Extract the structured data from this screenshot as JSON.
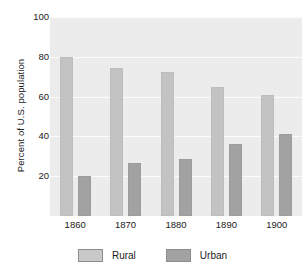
{
  "chart_data": {
    "type": "bar",
    "title": "",
    "xlabel": "",
    "ylabel": "Percent of U.S. population",
    "categories": [
      "1860",
      "1870",
      "1880",
      "1890",
      "1900"
    ],
    "series": [
      {
        "name": "Rural",
        "color": "#c3c3c3",
        "values": [
          80,
          74.5,
          72.5,
          65,
          61
        ]
      },
      {
        "name": "Urban",
        "color": "#a2a2a2",
        "values": [
          20,
          26.5,
          28.5,
          36,
          41
        ]
      }
    ],
    "ylim": [
      0,
      100
    ],
    "yticks": [
      20,
      40,
      60,
      80,
      100
    ],
    "ytick_labels": [
      "20",
      "40",
      "60",
      "80",
      "100"
    ],
    "grid": true,
    "legend_position": "bottom",
    "plot_background": "#ececec",
    "gridline_color": "#fbfbfb"
  },
  "legend": {
    "items": [
      {
        "label": "Rural"
      },
      {
        "label": "Urban"
      }
    ]
  }
}
